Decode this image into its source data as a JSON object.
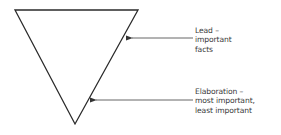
{
  "diagram": {
    "shape": "inverted-triangle",
    "stroke_color": "#2a2a2a",
    "arrow_color": "#555555",
    "text_color": "#3a3a3a",
    "annotations": [
      {
        "id": "lead",
        "lines": [
          "Lead –",
          "important",
          "facts"
        ]
      },
      {
        "id": "elaboration",
        "lines": [
          "Elaboration –",
          "most important,",
          "least important"
        ]
      }
    ]
  }
}
